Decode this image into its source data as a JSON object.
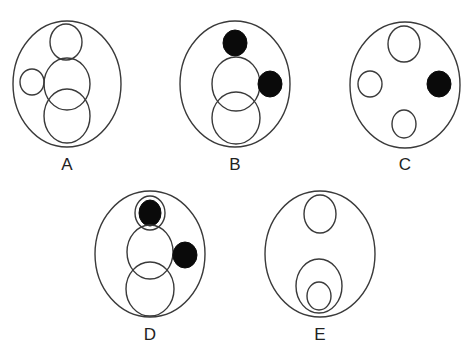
{
  "figures": [
    {
      "label": "A",
      "outer": {
        "cx": 67,
        "cy": 84,
        "rx": 54,
        "ry": 63
      },
      "shapes": [
        {
          "cx": 66,
          "cy": 42,
          "rx": 16,
          "ry": 18,
          "fill": "none"
        },
        {
          "cx": 32,
          "cy": 82,
          "rx": 12,
          "ry": 13,
          "fill": "none"
        },
        {
          "cx": 67,
          "cy": 84,
          "rx": 23,
          "ry": 26,
          "fill": "none"
        },
        {
          "cx": 67,
          "cy": 116,
          "rx": 23,
          "ry": 27,
          "fill": "none"
        }
      ],
      "label_pos": {
        "x": 67,
        "y": 170
      }
    },
    {
      "label": "B",
      "outer": {
        "cx": 235,
        "cy": 84,
        "rx": 55,
        "ry": 63
      },
      "shapes": [
        {
          "cx": 235,
          "cy": 43,
          "rx": 12,
          "ry": 13,
          "fill": "black"
        },
        {
          "cx": 236,
          "cy": 84,
          "rx": 24,
          "ry": 27,
          "fill": "none"
        },
        {
          "cx": 270,
          "cy": 84,
          "rx": 12,
          "ry": 13,
          "fill": "black"
        },
        {
          "cx": 236,
          "cy": 118,
          "rx": 24,
          "ry": 26,
          "fill": "none"
        }
      ],
      "label_pos": {
        "x": 235,
        "y": 170
      }
    },
    {
      "label": "C",
      "outer": {
        "cx": 405,
        "cy": 85,
        "rx": 55,
        "ry": 63
      },
      "shapes": [
        {
          "cx": 404,
          "cy": 44,
          "rx": 16,
          "ry": 18,
          "fill": "none"
        },
        {
          "cx": 370,
          "cy": 84,
          "rx": 12,
          "ry": 13,
          "fill": "none"
        },
        {
          "cx": 439,
          "cy": 84,
          "rx": 12,
          "ry": 13,
          "fill": "black"
        },
        {
          "cx": 404,
          "cy": 124,
          "rx": 12,
          "ry": 14,
          "fill": "none"
        }
      ],
      "label_pos": {
        "x": 405,
        "y": 170
      }
    },
    {
      "label": "D",
      "outer": {
        "cx": 150,
        "cy": 254,
        "rx": 55,
        "ry": 63
      },
      "shapes": [
        {
          "cx": 150,
          "cy": 213,
          "rx": 15,
          "ry": 17,
          "fill": "none"
        },
        {
          "cx": 150,
          "cy": 213,
          "rx": 11,
          "ry": 13,
          "fill": "black"
        },
        {
          "cx": 150,
          "cy": 252,
          "rx": 23,
          "ry": 27,
          "fill": "none"
        },
        {
          "cx": 185,
          "cy": 255,
          "rx": 12,
          "ry": 13,
          "fill": "black"
        },
        {
          "cx": 150,
          "cy": 289,
          "rx": 24,
          "ry": 27,
          "fill": "none"
        }
      ],
      "label_pos": {
        "x": 150,
        "y": 340
      }
    },
    {
      "label": "E",
      "outer": {
        "cx": 320,
        "cy": 254,
        "rx": 55,
        "ry": 63
      },
      "shapes": [
        {
          "cx": 320,
          "cy": 214,
          "rx": 16,
          "ry": 19,
          "fill": "none"
        },
        {
          "cx": 319,
          "cy": 286,
          "rx": 23,
          "ry": 27,
          "fill": "none"
        },
        {
          "cx": 319,
          "cy": 296,
          "rx": 12,
          "ry": 14,
          "fill": "none"
        }
      ],
      "label_pos": {
        "x": 320,
        "y": 340
      }
    }
  ]
}
